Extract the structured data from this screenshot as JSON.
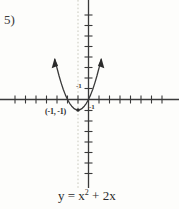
{
  "figure": {
    "problem_number": "5)",
    "equation_lhs": "y = x",
    "equation_exponent": "2",
    "equation_rhs": "+ 2x",
    "equation_full": "y = x² + 2x",
    "vertex_label": "(-1, -1)",
    "y_tick_label_above": "-1",
    "y_tick_label_below": "-1",
    "background_color": "#fdfdfb",
    "curve_color": "#3a3a3a",
    "axis_color": "#3a3a3a",
    "dashed_line_color": "#c9c9bd"
  },
  "chart_data": {
    "type": "line",
    "title": "",
    "subtitle": "",
    "xlabel": "",
    "ylabel": "",
    "function": "y = x^2 + 2x",
    "curve_label": "y = x² + 2x",
    "vertex": {
      "x": -1,
      "y": -1,
      "label": "(-1, -1)"
    },
    "roots": [
      -2,
      0
    ],
    "axis_of_symmetry": -1,
    "axis_of_symmetry_style": "dashed",
    "grid": false,
    "legend": null,
    "xlim": [
      -8.7,
      8.7
    ],
    "ylim": [
      -9.3,
      9.7
    ],
    "x_tick_step": 1,
    "y_tick_step": 1,
    "x_ticks": [
      -8,
      -7,
      -6,
      -5,
      -4,
      -3,
      -2,
      -1,
      1,
      2,
      3,
      4,
      5,
      6,
      7,
      8
    ],
    "y_ticks": [
      -9,
      -8,
      -7,
      -6,
      -5,
      -4,
      -3,
      -2,
      -1,
      1,
      2,
      3,
      4,
      5,
      6,
      7,
      8,
      9
    ],
    "tick_labels_shown": [
      "-1"
    ],
    "x_axis_arrows": false,
    "y_axis_arrows": false,
    "curve_arrows": [
      "up-left",
      "up-right"
    ],
    "series": [
      {
        "name": "y = x² + 2x",
        "x": [
          -3.2,
          -3.0,
          -2.8,
          -2.6,
          -2.4,
          -2.2,
          -2.0,
          -1.8,
          -1.6,
          -1.4,
          -1.2,
          -1.0,
          -0.8,
          -0.6,
          -0.4,
          -0.2,
          0.0,
          0.2,
          0.4,
          0.6,
          0.8,
          1.0,
          1.2
        ],
        "values": [
          3.84,
          3.0,
          2.24,
          1.56,
          0.96,
          0.44,
          0.0,
          -0.36,
          -0.64,
          -0.84,
          -0.96,
          -1.0,
          -0.96,
          -0.84,
          -0.64,
          -0.36,
          0.0,
          0.44,
          0.96,
          1.56,
          2.24,
          3.0,
          3.84
        ]
      }
    ],
    "annotations": [
      {
        "text": "(-1, -1)",
        "x": -1,
        "y": -1,
        "kind": "vertex-point-label"
      },
      {
        "text": "-1",
        "x": -1,
        "y": 0,
        "kind": "x-tick-label"
      },
      {
        "text": "-1",
        "x": 0,
        "y": -1,
        "kind": "y-tick-label"
      },
      {
        "text": "y = x² + 2x",
        "kind": "caption"
      },
      {
        "text": "5)",
        "kind": "problem-number"
      }
    ]
  }
}
